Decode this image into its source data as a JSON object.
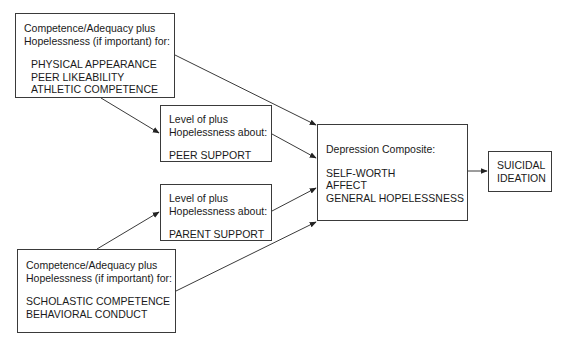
{
  "diagram": {
    "type": "path-model",
    "nodes": [
      {
        "id": "physical-peer-athletic",
        "header": [
          "Competence/Adequacy plus",
          "Hopelessness (if important) for:"
        ],
        "items": [
          "PHYSICAL APPEARANCE",
          "PEER LIKEABILITY",
          "ATHLETIC COMPETENCE"
        ]
      },
      {
        "id": "peer-support",
        "header": [
          "Level of plus",
          "Hopelessness about:"
        ],
        "items": [
          "PEER SUPPORT"
        ]
      },
      {
        "id": "parent-support",
        "header": [
          "Level of plus",
          "Hopelessness about:"
        ],
        "items": [
          "PARENT SUPPORT"
        ]
      },
      {
        "id": "scholastic-behavioral",
        "header": [
          "Competence/Adequacy plus",
          "Hopelessness (if important) for:"
        ],
        "items": [
          "SCHOLASTIC COMPETENCE",
          "BEHAVIORAL CONDUCT"
        ]
      },
      {
        "id": "depression-composite",
        "header": [
          "Depression Composite:"
        ],
        "items": [
          "SELF-WORTH",
          "AFFECT",
          "GENERAL HOPELESSNESS"
        ]
      },
      {
        "id": "suicidal-ideation",
        "header": [],
        "items": [
          "SUICIDAL",
          "IDEATION"
        ]
      }
    ],
    "edges": [
      {
        "from": "physical-peer-athletic",
        "to": "peer-support"
      },
      {
        "from": "physical-peer-athletic",
        "to": "depression-composite"
      },
      {
        "from": "peer-support",
        "to": "depression-composite"
      },
      {
        "from": "parent-support",
        "to": "depression-composite"
      },
      {
        "from": "scholastic-behavioral",
        "to": "parent-support"
      },
      {
        "from": "scholastic-behavioral",
        "to": "depression-composite"
      },
      {
        "from": "depression-composite",
        "to": "suicidal-ideation"
      }
    ],
    "colors": {
      "line": "#3a3a3a",
      "box_border": "#3a3a3a",
      "text": "#1a1a1a"
    }
  }
}
